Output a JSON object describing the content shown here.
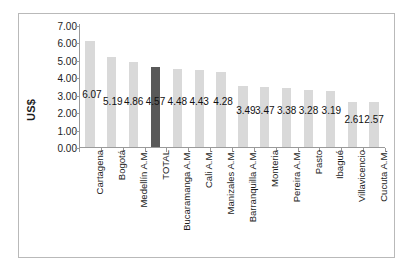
{
  "chart_data": {
    "type": "bar",
    "title": "",
    "subtitle": "",
    "xlabel": "",
    "ylabel": "US$",
    "ylim": [
      0.0,
      7.0
    ],
    "ytick_labels": [
      "0.00",
      "1.00",
      "2.00",
      "3.00",
      "4.00",
      "5.00",
      "6.00",
      "7.00"
    ],
    "ytick_values": [
      0,
      1,
      2,
      3,
      4,
      5,
      6,
      7
    ],
    "grid": false,
    "legend": "none",
    "categories": [
      "Cartagena",
      "Bogotá",
      "Medellín A.M.",
      "TOTAL",
      "Bucaramanga A.M.",
      "Cali A.M.",
      "Manizales A.M.",
      "Barranquilla A.M.",
      "Monteria",
      "Pereira A.M.",
      "Pasto",
      "Ibagué",
      "Villavicencio",
      "Cucuta A.M."
    ],
    "values": [
      6.07,
      5.19,
      4.86,
      4.57,
      4.48,
      4.43,
      4.28,
      3.49,
      3.47,
      3.38,
      3.28,
      3.19,
      2.61,
      2.57
    ],
    "value_labels": [
      "6.07",
      "5.19",
      "4.86",
      "4.57",
      "4.48",
      "4.43",
      "4.28",
      "3.49",
      "3.47",
      "3.38",
      "3.28",
      "3.19",
      "2.61",
      "2.57"
    ],
    "highlight_index": 3,
    "colors": {
      "bar": "#d9d9d9",
      "bar_highlight": "#595959",
      "axis": "#9a9a9a",
      "frame": "#b9b9b9",
      "text": "#1c1c1c",
      "background": "#ffffff"
    }
  }
}
